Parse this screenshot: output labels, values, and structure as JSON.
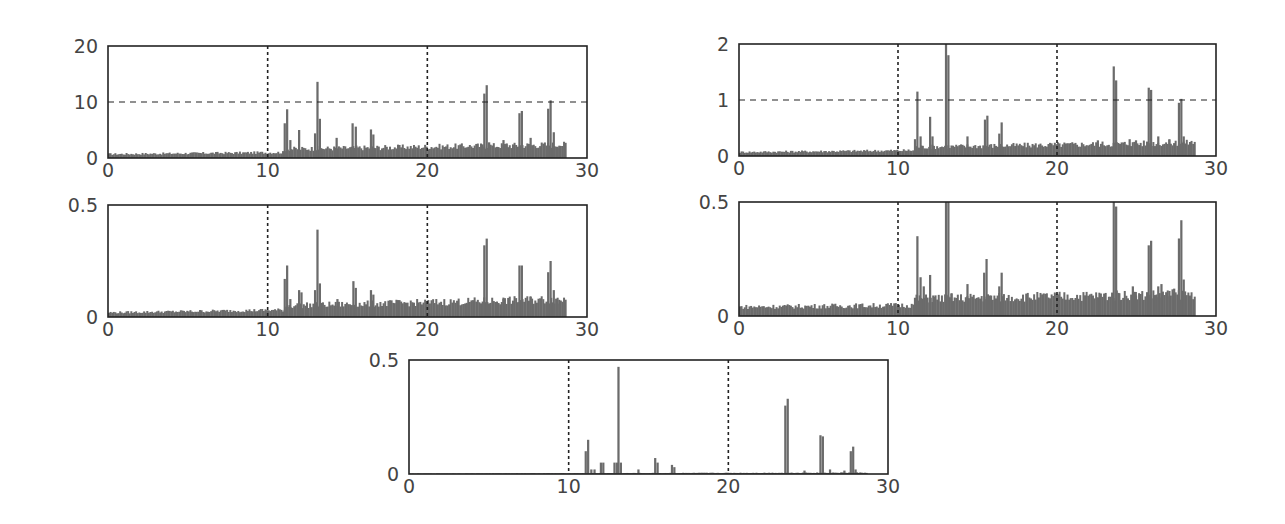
{
  "style": {
    "bar_color": "#6b6b6b",
    "axis_color": "#222222",
    "text_color": "#454545",
    "grid_color": "#222222"
  },
  "chart_data": [
    {
      "id": "panel-top-left",
      "type": "bar",
      "title": "",
      "xlabel": "",
      "ylabel": "",
      "xlim": [
        0,
        30
      ],
      "ylim": [
        0,
        20
      ],
      "xticks": [
        0,
        10,
        20,
        30
      ],
      "yticks": [
        0,
        10,
        20
      ],
      "xtick_labels": [
        "0",
        "10",
        "20",
        "30"
      ],
      "ytick_labels": [
        "0",
        "10",
        "20"
      ],
      "vgrid": [
        10,
        20
      ],
      "hgrid": [
        10
      ],
      "baseline": {
        "x_end": 28.7,
        "level_start": 0.7,
        "level_end": 1.5
      },
      "peaks": [
        [
          11.0,
          6.2
        ],
        [
          11.15,
          8.7
        ],
        [
          11.35,
          3.2
        ],
        [
          11.9,
          5.0
        ],
        [
          12.9,
          4.4
        ],
        [
          13.05,
          13.6
        ],
        [
          13.2,
          7.0
        ],
        [
          14.25,
          3.6
        ],
        [
          15.25,
          6.2
        ],
        [
          15.45,
          5.6
        ],
        [
          16.4,
          5.1
        ],
        [
          16.55,
          4.2
        ],
        [
          22.5,
          2.0
        ],
        [
          23.5,
          11.5
        ],
        [
          23.65,
          13.0
        ],
        [
          23.8,
          2.8
        ],
        [
          24.7,
          3.2
        ],
        [
          24.9,
          2.6
        ],
        [
          25.7,
          8.0
        ],
        [
          25.85,
          8.4
        ],
        [
          26.4,
          3.6
        ],
        [
          27.5,
          8.8
        ],
        [
          27.65,
          10.3
        ],
        [
          27.85,
          4.6
        ],
        [
          28.2,
          2.2
        ]
      ],
      "plot_px": {
        "left": 108,
        "top": 46,
        "right": 587,
        "bottom": 158
      }
    },
    {
      "id": "panel-top-right",
      "type": "bar",
      "title": "",
      "xlabel": "",
      "ylabel": "",
      "xlim": [
        0,
        30
      ],
      "ylim": [
        0,
        2
      ],
      "xticks": [
        0,
        10,
        20,
        30
      ],
      "yticks": [
        0,
        1,
        2
      ],
      "xtick_labels": [
        "0",
        "10",
        "20",
        "30"
      ],
      "ytick_labels": [
        "0",
        "1",
        "2"
      ],
      "vgrid": [
        10,
        20
      ],
      "hgrid": [
        1
      ],
      "baseline": {
        "x_end": 28.7,
        "level_start": 0.07,
        "level_end": 0.15
      },
      "peaks": [
        [
          11.0,
          0.3
        ],
        [
          11.15,
          1.15
        ],
        [
          11.35,
          0.35
        ],
        [
          11.95,
          0.7
        ],
        [
          12.1,
          0.35
        ],
        [
          12.95,
          2.0
        ],
        [
          13.1,
          1.8
        ],
        [
          14.3,
          0.35
        ],
        [
          15.4,
          0.65
        ],
        [
          15.55,
          0.72
        ],
        [
          16.45,
          0.6
        ],
        [
          16.3,
          0.4
        ],
        [
          22.5,
          0.28
        ],
        [
          23.5,
          1.6
        ],
        [
          23.65,
          1.35
        ],
        [
          24.5,
          0.3
        ],
        [
          24.9,
          0.28
        ],
        [
          25.7,
          1.22
        ],
        [
          25.85,
          1.18
        ],
        [
          26.3,
          0.35
        ],
        [
          27.0,
          0.3
        ],
        [
          27.6,
          0.95
        ],
        [
          27.75,
          1.02
        ],
        [
          27.9,
          0.35
        ],
        [
          28.3,
          0.25
        ]
      ],
      "plot_px": {
        "left": 739,
        "top": 44,
        "right": 1216,
        "bottom": 156
      }
    },
    {
      "id": "panel-middle-left",
      "type": "bar",
      "title": "",
      "xlabel": "",
      "ylabel": "",
      "xlim": [
        0,
        30
      ],
      "ylim": [
        0,
        0.5
      ],
      "xticks": [
        0,
        10,
        20,
        30
      ],
      "yticks": [
        0,
        0.5
      ],
      "xtick_labels": [
        "0",
        "10",
        "20",
        "30"
      ],
      "ytick_labels": [
        "0",
        "0.5"
      ],
      "vgrid": [
        10,
        20
      ],
      "hgrid": [],
      "baseline": {
        "x_end": 28.7,
        "level_start": 0.02,
        "level_end": 0.05
      },
      "peaks": [
        [
          11.0,
          0.17
        ],
        [
          11.15,
          0.23
        ],
        [
          11.35,
          0.08
        ],
        [
          11.9,
          0.12
        ],
        [
          12.05,
          0.11
        ],
        [
          12.9,
          0.12
        ],
        [
          13.05,
          0.39
        ],
        [
          13.2,
          0.15
        ],
        [
          14.3,
          0.08
        ],
        [
          15.3,
          0.16
        ],
        [
          15.45,
          0.13
        ],
        [
          16.4,
          0.12
        ],
        [
          16.55,
          0.1
        ],
        [
          22.5,
          0.06
        ],
        [
          23.5,
          0.32
        ],
        [
          23.65,
          0.35
        ],
        [
          24.7,
          0.08
        ],
        [
          25.7,
          0.23
        ],
        [
          25.85,
          0.23
        ],
        [
          26.4,
          0.09
        ],
        [
          27.5,
          0.2
        ],
        [
          27.65,
          0.25
        ],
        [
          27.85,
          0.12
        ],
        [
          28.2,
          0.06
        ]
      ],
      "plot_px": {
        "left": 108,
        "top": 205,
        "right": 587,
        "bottom": 317
      }
    },
    {
      "id": "panel-middle-right",
      "type": "bar",
      "title": "",
      "xlabel": "",
      "ylabel": "",
      "xlim": [
        0,
        30
      ],
      "ylim": [
        0,
        0.5
      ],
      "xticks": [
        0,
        10,
        20,
        30
      ],
      "yticks": [
        0,
        0.5
      ],
      "xtick_labels": [
        "0",
        "10",
        "20",
        "30"
      ],
      "ytick_labels": [
        "0",
        "0.5"
      ],
      "vgrid": [
        10,
        20
      ],
      "hgrid": [],
      "baseline": {
        "x_end": 28.7,
        "level_start": 0.04,
        "level_end": 0.06
      },
      "peaks": [
        [
          11.0,
          0.08
        ],
        [
          11.15,
          0.35
        ],
        [
          11.35,
          0.17
        ],
        [
          11.55,
          0.13
        ],
        [
          11.95,
          0.18
        ],
        [
          12.15,
          0.09
        ],
        [
          12.95,
          0.5
        ],
        [
          13.1,
          0.5
        ],
        [
          13.3,
          0.1
        ],
        [
          14.3,
          0.14
        ],
        [
          15.35,
          0.19
        ],
        [
          15.5,
          0.25
        ],
        [
          15.7,
          0.09
        ],
        [
          16.45,
          0.19
        ],
        [
          16.3,
          0.13
        ],
        [
          22.5,
          0.08
        ],
        [
          23.5,
          0.5
        ],
        [
          23.65,
          0.48
        ],
        [
          23.85,
          0.1
        ],
        [
          24.7,
          0.13
        ],
        [
          24.9,
          0.09
        ],
        [
          25.7,
          0.31
        ],
        [
          25.85,
          0.33
        ],
        [
          26.3,
          0.13
        ],
        [
          26.5,
          0.14
        ],
        [
          27.0,
          0.11
        ],
        [
          27.3,
          0.12
        ],
        [
          27.6,
          0.34
        ],
        [
          27.75,
          0.42
        ],
        [
          27.9,
          0.16
        ],
        [
          28.3,
          0.08
        ]
      ],
      "plot_px": {
        "left": 739,
        "top": 202,
        "right": 1216,
        "bottom": 316
      }
    },
    {
      "id": "panel-bottom-center",
      "type": "bar",
      "title": "",
      "xlabel": "",
      "ylabel": "",
      "xlim": [
        0,
        30
      ],
      "ylim": [
        0,
        0.5
      ],
      "xticks": [
        0,
        10,
        20,
        30
      ],
      "yticks": [
        0,
        0.5
      ],
      "xtick_labels": [
        "0",
        "10",
        "20",
        "30"
      ],
      "ytick_labels": [
        "0",
        "0.5"
      ],
      "vgrid": [
        10,
        20
      ],
      "hgrid": [],
      "baseline": {
        "x_end": 28.7,
        "level_start": 0.002,
        "level_end": 0.006
      },
      "peaks": [
        [
          11.0,
          0.1
        ],
        [
          11.15,
          0.15
        ],
        [
          11.35,
          0.02
        ],
        [
          11.55,
          0.02
        ],
        [
          11.95,
          0.05
        ],
        [
          12.1,
          0.05
        ],
        [
          12.8,
          0.05
        ],
        [
          12.95,
          0.05
        ],
        [
          13.05,
          0.47
        ],
        [
          13.2,
          0.05
        ],
        [
          14.3,
          0.02
        ],
        [
          15.35,
          0.07
        ],
        [
          15.5,
          0.05
        ],
        [
          16.4,
          0.04
        ],
        [
          16.55,
          0.03
        ],
        [
          23.5,
          0.3
        ],
        [
          23.65,
          0.33
        ],
        [
          24.7,
          0.015
        ],
        [
          25.7,
          0.17
        ],
        [
          25.85,
          0.165
        ],
        [
          26.3,
          0.02
        ],
        [
          27.2,
          0.015
        ],
        [
          27.6,
          0.1
        ],
        [
          27.75,
          0.12
        ],
        [
          27.9,
          0.02
        ]
      ],
      "plot_px": {
        "left": 409,
        "top": 360,
        "right": 888,
        "bottom": 474
      }
    }
  ]
}
